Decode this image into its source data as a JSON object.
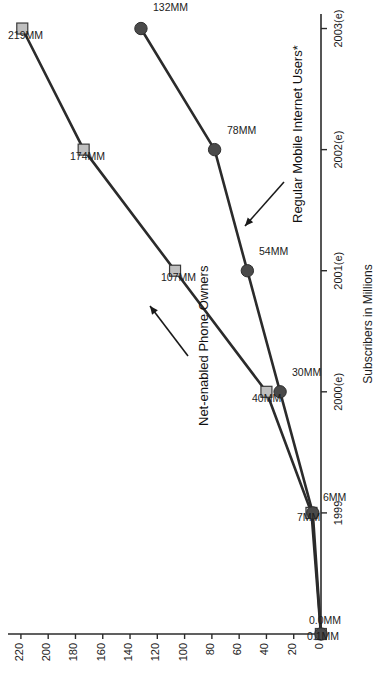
{
  "chart_data": {
    "type": "line",
    "title": "",
    "xlabel": "",
    "ylabel": "Subscribers in Millions",
    "categories": [
      "",
      "1999",
      "2000(e)",
      "2001(e)",
      "2002(e)",
      "2003(e)"
    ],
    "x_tick_labels": [
      "1999",
      "2000(e)",
      "2001(e)",
      "2002(e)",
      "2003(e)"
    ],
    "y_tick_labels": [
      "0",
      "20",
      "40",
      "60",
      "80",
      "100",
      "120",
      "140",
      "160",
      "180",
      "200",
      "220"
    ],
    "y_ticks": [
      0,
      20,
      40,
      60,
      80,
      100,
      120,
      140,
      160,
      180,
      200,
      220
    ],
    "ylim": [
      0,
      228
    ],
    "grid": false,
    "legend_position": "inline-annotations",
    "series": [
      {
        "name": "Net-enabled Phone Owners",
        "marker": "square",
        "marker_color": "#bfbfbf",
        "line_color": "#2b2b2b",
        "values": [
          0.1,
          7,
          40,
          107,
          174,
          219
        ],
        "point_labels": [
          "0.1MM",
          "7MM",
          "40MM",
          "107MM",
          "174MM",
          "219MM"
        ]
      },
      {
        "name": "Regular Mobile Internet Users*",
        "marker": "circle",
        "marker_color": "#4a4a4a",
        "line_color": "#2b2b2b",
        "values": [
          0.0,
          6,
          30,
          54,
          78,
          132
        ],
        "point_labels": [
          "0.0MM",
          "6MM",
          "30MM",
          "54MM",
          "78MM",
          "132MM"
        ]
      }
    ],
    "annotations": [
      {
        "text": "Net-enabled Phone Owners",
        "points_to_series": "Net-enabled Phone Owners"
      },
      {
        "text": "Regular Mobile Internet Users*",
        "points_to_series": "Regular Mobile Internet Users*"
      }
    ]
  },
  "axis": {
    "y_title": "Subscribers in Millions"
  },
  "colors": {
    "axis": "#2b2b2b",
    "line": "#2b2b2b",
    "square_marker_fill": "#bfbfbf",
    "circle_marker_fill": "#4a4a4a",
    "text": "#1c1c1c",
    "background": "#ffffff"
  }
}
